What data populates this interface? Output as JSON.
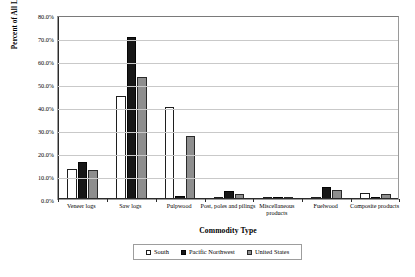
{
  "chart_data": {
    "type": "bar",
    "title": "",
    "xlabel": "Commodity Type",
    "ylabel": "Percent of All Logs",
    "ylim": [
      0,
      80
    ],
    "ytick_labels": [
      "80.0%",
      "70.0%",
      "60.0%",
      "50.0%",
      "40.0%",
      "30.0%",
      "20.0%",
      "10.0%",
      "0.0%"
    ],
    "ytick_values": [
      80,
      70,
      60,
      50,
      40,
      30,
      20,
      10,
      0
    ],
    "grid": true,
    "legend_position": "bottom",
    "categories": [
      "Veneer logs",
      "Saw logs",
      "Pulpwood",
      "Post, poles and pilings",
      "Miscellaneous products",
      "Fuelwood",
      "Composite products"
    ],
    "series": [
      {
        "name": "South",
        "color": "#ffffff",
        "values": [
          13.0,
          45.0,
          40.0,
          1.0,
          0.3,
          0.6,
          2.6
        ]
      },
      {
        "name": "Pacific Northwest",
        "color": "#171717",
        "values": [
          16.2,
          70.5,
          1.5,
          3.6,
          0.9,
          5.2,
          0.2
        ]
      },
      {
        "name": "United States",
        "color": "#8e8e8e",
        "values": [
          12.6,
          53.0,
          27.5,
          2.0,
          0.9,
          4.1,
          2.1
        ]
      }
    ]
  },
  "legend": {
    "items": [
      {
        "label": "South",
        "style": "s-white"
      },
      {
        "label": "Pacific Northwest",
        "style": "s-black"
      },
      {
        "label": "United States",
        "style": "s-gray"
      }
    ]
  }
}
